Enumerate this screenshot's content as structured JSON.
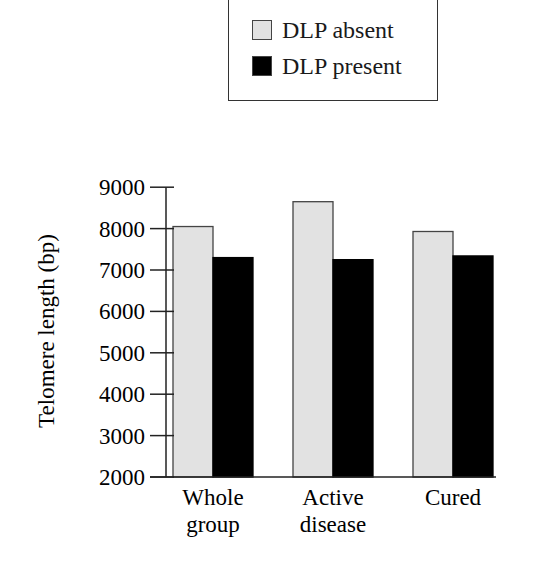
{
  "chart_data": {
    "type": "bar",
    "title": "",
    "xlabel": "",
    "ylabel": "Telomere length (bp)",
    "ylim": [
      2000,
      9000
    ],
    "yticks": [
      2000,
      3000,
      4000,
      5000,
      6000,
      7000,
      8000,
      9000
    ],
    "categories": [
      "Whole group",
      "Active disease",
      "Cured"
    ],
    "category_lines": [
      [
        "Whole",
        "group"
      ],
      [
        "Active",
        "disease"
      ],
      [
        "Cured"
      ]
    ],
    "series": [
      {
        "name": "DLP absent",
        "color": "#e2e2e2",
        "values": [
          8050,
          8650,
          7930
        ]
      },
      {
        "name": "DLP present",
        "color": "#000000",
        "values": [
          7300,
          7250,
          7340
        ]
      }
    ],
    "grid": false,
    "legend_position": "top-center, boxed"
  },
  "legend": {
    "items": [
      {
        "label": "DLP absent",
        "color": "#e2e2e2"
      },
      {
        "label": "DLP present",
        "color": "#000000"
      }
    ]
  }
}
